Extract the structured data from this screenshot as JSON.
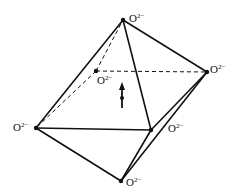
{
  "diagram": {
    "vertices": [
      {
        "id": "top",
        "x": 123,
        "y": 20,
        "label": "O",
        "charge": "2−"
      },
      {
        "id": "right",
        "x": 207,
        "y": 72,
        "label": "O",
        "charge": "2−"
      },
      {
        "id": "back",
        "x": 96,
        "y": 71,
        "label": "O",
        "charge": "2−"
      },
      {
        "id": "left",
        "x": 36,
        "y": 128,
        "label": "O",
        "charge": "2−"
      },
      {
        "id": "front",
        "x": 151,
        "y": 130,
        "label": "O",
        "charge": "2−"
      },
      {
        "id": "bottom",
        "x": 121,
        "y": 181,
        "label": "O",
        "charge": "2−"
      }
    ],
    "central_ion": {
      "x": 122,
      "y": 98,
      "arrow_direction": "up"
    },
    "colors": {
      "line": "#111111",
      "background": "#ffffff"
    }
  }
}
